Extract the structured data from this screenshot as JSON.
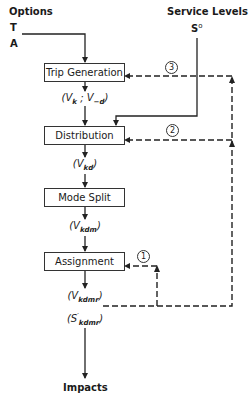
{
  "inputs": {
    "options_title": "Options",
    "option_t": "T",
    "option_a": "A",
    "service_levels_title": "Service Levels",
    "service_levels_symbol": "S",
    "service_levels_superscript": "o"
  },
  "boxes": [
    {
      "id": "trip-generation",
      "label": "Trip Generation"
    },
    {
      "id": "distribution",
      "label": "Distribution"
    },
    {
      "id": "mode-split",
      "label": "Mode Split"
    },
    {
      "id": "assignment",
      "label": "Assignment"
    }
  ],
  "flows": {
    "trip_gen_out": {
      "open": "(V",
      "sub1": "k",
      "sep": " ; V",
      "sub2": "−d",
      "close": ")"
    },
    "distribution_out": {
      "open": "(V",
      "sub": "kd",
      "close": ")"
    },
    "mode_split_out": {
      "open": "(V",
      "sub": "kdm",
      "close": ")"
    },
    "assignment_out_volume": {
      "open": "(V",
      "sub": "kdmr",
      "close": ")"
    },
    "assignment_out_service": {
      "open": "(S",
      "sup": "′",
      "sub": "kdmr",
      "close": ")"
    }
  },
  "feedback_loops": [
    {
      "number": "1",
      "target": "Assignment"
    },
    {
      "number": "2",
      "target": "Distribution"
    },
    {
      "number": "3",
      "target": "Trip Generation"
    }
  ],
  "output": {
    "impacts_label": "Impacts"
  }
}
